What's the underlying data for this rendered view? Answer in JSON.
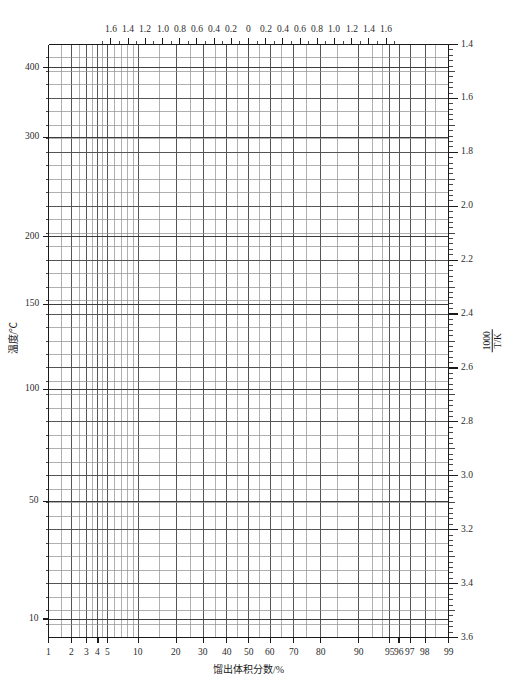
{
  "chart_data": {
    "type": "grid-paper",
    "title": "",
    "subtitle": "",
    "grid": true,
    "legend": null,
    "x_axis_bottom": {
      "label": "馏出体积分数/%",
      "scale": "probability",
      "min": 1,
      "max": 99,
      "tick_labels": [
        "1",
        "2",
        "3",
        "4",
        "5",
        "10",
        "20",
        "30",
        "40",
        "50",
        "60",
        "70",
        "80",
        "90",
        "95",
        "96",
        "97",
        "98",
        "99"
      ],
      "tick_values": [
        1,
        2,
        3,
        4,
        5,
        10,
        20,
        30,
        40,
        50,
        60,
        70,
        80,
        90,
        95,
        96,
        97,
        98,
        99
      ]
    },
    "x_axis_top": {
      "label": "",
      "scale": "normal-deviate",
      "tick_labels": [
        "1.6",
        "1.4",
        "1.2",
        "1.0",
        "0.8",
        "0.6",
        "0.4",
        "0.2",
        "0",
        "0.2",
        "0.4",
        "0.6",
        "0.8",
        "1.0",
        "1.2",
        "1.4",
        "1.6"
      ],
      "tick_values": [
        -1.6,
        -1.4,
        -1.2,
        -1.0,
        -0.8,
        -0.6,
        -0.4,
        -0.2,
        0,
        0.2,
        0.4,
        0.6,
        0.8,
        1.0,
        1.2,
        1.4,
        1.6
      ]
    },
    "y_axis_left": {
      "label": "温度/℃",
      "scale": "reciprocal-absolute-temperature",
      "unit": "℃",
      "tick_labels": [
        "400",
        "300",
        "200",
        "150",
        "100",
        "50",
        "10"
      ],
      "tick_values": [
        400,
        300,
        200,
        150,
        100,
        50,
        10
      ]
    },
    "y_axis_right": {
      "label_numerator": "1000",
      "label_denominator": "T/K",
      "scale": "linear",
      "min": 1.4,
      "max": 3.6,
      "tick_labels": [
        "1.4",
        "1.6",
        "1.8",
        "2.0",
        "2.2",
        "2.4",
        "2.6",
        "2.8",
        "3.0",
        "3.2",
        "3.4",
        "3.6"
      ],
      "tick_values": [
        1.4,
        1.6,
        1.8,
        2.0,
        2.2,
        2.4,
        2.6,
        2.8,
        3.0,
        3.2,
        3.4,
        3.6
      ]
    },
    "colors": {
      "grid_major": "#555555",
      "grid_minor": "#8f8f8f",
      "frame": "#1a1a1a",
      "text": "#1a1a1a",
      "background": "#ffffff"
    }
  }
}
